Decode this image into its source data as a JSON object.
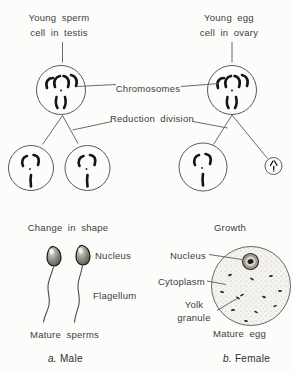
{
  "diagram": {
    "background": "#fcfcfa",
    "colors": {
      "ink": "#3c3c3c",
      "outline": "#5a5a5a",
      "chromosome": "#151515",
      "egg_fill": "#f4f3f0",
      "nucleus_fill": "#9e9890"
    },
    "shared_labels": {
      "chromosomes": "Chromosomes",
      "reduction_division": "Reduction division"
    },
    "male": {
      "young_cell_line1": "Young sperm",
      "young_cell_line2": "cell in testis",
      "stage_label": "Change in shape",
      "part_nucleus": "Nucleus",
      "part_flagellum": "Flagellum",
      "mature_label": "Mature sperms",
      "caption_index": "a.",
      "caption_text": "Male"
    },
    "female": {
      "young_cell_line1": "Young egg",
      "young_cell_line2": "cell in ovary",
      "stage_label": "Growth",
      "part_nucleus": "Nucleus",
      "part_cytoplasm": "Cytoplasm",
      "part_yolk_line1": "Yolk",
      "part_yolk_line2": "granule",
      "mature_label": "Mature egg",
      "caption_index": "b.",
      "caption_text": "Female"
    }
  }
}
